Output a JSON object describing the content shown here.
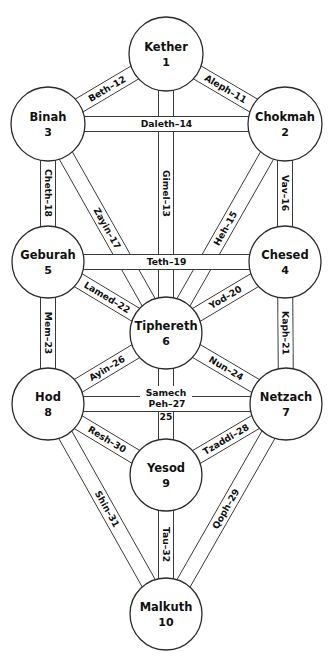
{
  "diagram": {
    "background_color": "#ffffff",
    "line_color": "#2b2b2b",
    "text_color": "#111111",
    "sephiroth": [
      {
        "id": "kether",
        "name": "Kether",
        "number": "1",
        "cx": 166,
        "cy": 54,
        "r": 37
      },
      {
        "id": "chokmah",
        "name": "Chokmah",
        "number": "2",
        "cx": 285,
        "cy": 124,
        "r": 37
      },
      {
        "id": "binah",
        "name": "Binah",
        "number": "3",
        "cx": 48,
        "cy": 124,
        "r": 37
      },
      {
        "id": "chesed",
        "name": "Chesed",
        "number": "4",
        "cx": 285,
        "cy": 262,
        "r": 36
      },
      {
        "id": "geburah",
        "name": "Geburah",
        "number": "5",
        "cx": 48,
        "cy": 262,
        "r": 36
      },
      {
        "id": "tiphereth",
        "name": "Tiphereth",
        "number": "6",
        "cx": 166,
        "cy": 333,
        "r": 36
      },
      {
        "id": "netzach",
        "name": "Netzach",
        "number": "7",
        "cx": 286,
        "cy": 404,
        "r": 36
      },
      {
        "id": "hod",
        "name": "Hod",
        "number": "8",
        "cx": 48,
        "cy": 404,
        "r": 36
      },
      {
        "id": "yesod",
        "name": "Yesod",
        "number": "9",
        "cx": 166,
        "cy": 475,
        "r": 36
      },
      {
        "id": "malkuth",
        "name": "Malkuth",
        "number": "10",
        "cx": 166,
        "cy": 614,
        "r": 36
      }
    ],
    "paths": [
      {
        "id": "aleph-11",
        "label": "Aleph–11",
        "number": "11",
        "letter": "Aleph",
        "from": "kether",
        "to": "chokmah",
        "width": 15
      },
      {
        "id": "beth-12",
        "label": "Beth–12",
        "number": "12",
        "letter": "Beth",
        "from": "kether",
        "to": "binah",
        "width": 15
      },
      {
        "id": "gimel-13",
        "label": "Gimel–13",
        "number": "13",
        "letter": "Gimel",
        "from": "kether",
        "to": "tiphereth",
        "width": 15
      },
      {
        "id": "daleth-14",
        "label": "Daleth–14",
        "number": "14",
        "letter": "Daleth",
        "from": "binah",
        "to": "chokmah",
        "width": 15
      },
      {
        "id": "heh-15",
        "label": "Heh–15",
        "number": "15",
        "letter": "Heh",
        "from": "chokmah",
        "to": "tiphereth",
        "width": 15
      },
      {
        "id": "vav-16",
        "label": "Vav–16",
        "number": "16",
        "letter": "Vav",
        "from": "chokmah",
        "to": "chesed",
        "width": 15
      },
      {
        "id": "zayin-17",
        "label": "Zayin–17",
        "number": "17",
        "letter": "Zayin",
        "from": "binah",
        "to": "tiphereth",
        "width": 15
      },
      {
        "id": "cheth-18",
        "label": "Cheth–18",
        "number": "18",
        "letter": "Cheth",
        "from": "binah",
        "to": "geburah",
        "width": 15
      },
      {
        "id": "teth-19",
        "label": "Teth–19",
        "number": "19",
        "letter": "Teth",
        "from": "geburah",
        "to": "chesed",
        "width": 15
      },
      {
        "id": "yod-20",
        "label": "Yod–20",
        "number": "20",
        "letter": "Yod",
        "from": "chesed",
        "to": "tiphereth",
        "width": 15
      },
      {
        "id": "kaph-21",
        "label": "Kaph–21",
        "number": "21",
        "letter": "Kaph",
        "from": "chesed",
        "to": "netzach",
        "width": 15
      },
      {
        "id": "lamed-22",
        "label": "Lamed–22",
        "number": "22",
        "letter": "Lamed",
        "from": "geburah",
        "to": "tiphereth",
        "width": 15
      },
      {
        "id": "mem-23",
        "label": "Mem–23",
        "number": "23",
        "letter": "Mem",
        "from": "geburah",
        "to": "hod",
        "width": 15
      },
      {
        "id": "nun-24",
        "label": "Nun–24",
        "number": "24",
        "letter": "Nun",
        "from": "tiphereth",
        "to": "netzach",
        "width": 15
      },
      {
        "id": "samech-25",
        "label": "Samech–25",
        "number": "25",
        "letter": "Samech",
        "from": "tiphereth",
        "to": "yesod",
        "width": 15
      },
      {
        "id": "ayin-26",
        "label": "Ayin–26",
        "number": "26",
        "letter": "Ayin",
        "from": "tiphereth",
        "to": "hod",
        "width": 15
      },
      {
        "id": "peh-27",
        "label": "Peh–27",
        "number": "27",
        "letter": "Peh",
        "from": "hod",
        "to": "netzach",
        "width": 15
      },
      {
        "id": "tzaddi-28",
        "label": "Tzaddi–28",
        "number": "28",
        "letter": "Tzaddi",
        "from": "netzach",
        "to": "yesod",
        "width": 15
      },
      {
        "id": "qoph-29",
        "label": "Qoph–29",
        "number": "29",
        "letter": "Qoph",
        "from": "netzach",
        "to": "malkuth",
        "width": 15
      },
      {
        "id": "resh-30",
        "label": "Resh–30",
        "number": "30",
        "letter": "Resh",
        "from": "hod",
        "to": "yesod",
        "width": 15
      },
      {
        "id": "shin-31",
        "label": "Shin–31",
        "number": "31",
        "letter": "Shin",
        "from": "hod",
        "to": "malkuth",
        "width": 15
      },
      {
        "id": "tau-32",
        "label": "Tau–32",
        "number": "32",
        "letter": "Tau",
        "from": "yesod",
        "to": "malkuth",
        "width": 15
      }
    ],
    "split_labels": {
      "samech-25": {
        "top": "Samech",
        "bottom": "25"
      }
    }
  }
}
